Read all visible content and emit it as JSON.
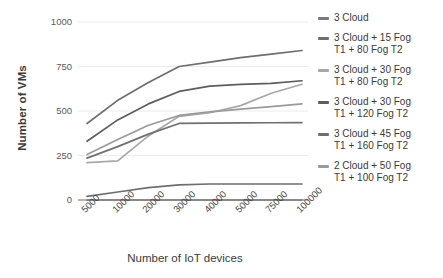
{
  "chart_data": {
    "type": "line",
    "title": "",
    "xlabel": "Number of IoT devices",
    "ylabel": "Number of VMs",
    "categories": [
      "5000",
      "10000",
      "20000",
      "30000",
      "40000",
      "50000",
      "75000",
      "100000"
    ],
    "ylim": [
      0,
      1000
    ],
    "yticks": [
      0,
      250,
      500,
      750,
      1000
    ],
    "ytick_labels": [
      "0",
      "250",
      "500",
      "750",
      "1000"
    ],
    "grid": true,
    "grid_axis": "y",
    "legend_position": "right",
    "series": [
      {
        "name": "3 Cloud",
        "color": "#7a7a7a",
        "values": [
          0,
          0,
          0,
          0,
          0,
          0,
          0,
          0
        ]
      },
      {
        "name": "3 Cloud  + 15 Fog\nT1 + 80 Fog T2",
        "color": "#6e6e6e",
        "values": [
          430,
          560,
          660,
          750,
          775,
          800,
          820,
          840
        ]
      },
      {
        "name": "3 Cloud + 30 Fog\nT1 + 80 Fog T2",
        "color": "#a8a8a8",
        "values": [
          210,
          220,
          360,
          470,
          490,
          530,
          600,
          650
        ]
      },
      {
        "name": "3 Cloud + 30 Fog\nT1 + 120 Fog T2",
        "color": "#5d5d5d",
        "values": [
          330,
          450,
          540,
          610,
          640,
          650,
          655,
          670
        ]
      },
      {
        "name": "3 Cloud + 45 Fog\nT1 + 160 Fog T2",
        "color": "#707070",
        "values": [
          235,
          300,
          370,
          430,
          432,
          433,
          434,
          435
        ]
      },
      {
        "name": "2 Cloud + 50 Fog\nT1 + 100 Fog T2",
        "color": "#9a9a9a",
        "values": [
          255,
          340,
          420,
          475,
          495,
          510,
          525,
          540
        ]
      }
    ],
    "extra_low_series": {
      "name": "low-baseline-curve",
      "color": "#6e6e6e",
      "values": [
        20,
        45,
        70,
        85,
        90,
        90,
        90,
        90
      ]
    }
  },
  "axes": {
    "y_title": "Number of  VMs",
    "x_title": "Number of IoT devices"
  },
  "legend": {
    "items": [
      {
        "label": "3 Cloud",
        "color": "#7a7a7a"
      },
      {
        "label": "3 Cloud  + 15 Fog\nT1 + 80 Fog T2",
        "color": "#6e6e6e"
      },
      {
        "label": "3 Cloud + 30 Fog\nT1 + 80 Fog T2",
        "color": "#a8a8a8"
      },
      {
        "label": "3 Cloud + 30 Fog\nT1 + 120 Fog T2",
        "color": "#5d5d5d"
      },
      {
        "label": "3 Cloud + 45 Fog\nT1 + 160 Fog T2",
        "color": "#707070"
      },
      {
        "label": "2 Cloud + 50 Fog\nT1 + 100 Fog T2",
        "color": "#9a9a9a"
      }
    ]
  },
  "style": {
    "grid_color": "#ebebeb",
    "text_color": "#3b3b3b",
    "tick_color": "#5a5a5a",
    "background": "#ffffff"
  }
}
